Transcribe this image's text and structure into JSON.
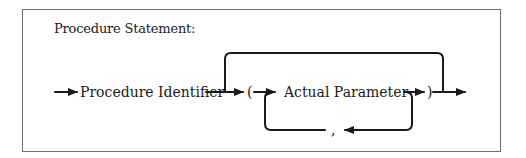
{
  "diagram": {
    "title": "Procedure Statement:",
    "nodes": {
      "procedure_identifier": "Procedure Identifier",
      "open_paren": "(",
      "actual_parameter": "Actual Parameter",
      "close_paren": ")",
      "comma": ","
    },
    "edges": [
      {
        "from": "start",
        "to": "procedure_identifier"
      },
      {
        "from": "procedure_identifier",
        "to": "open_paren"
      },
      {
        "from": "procedure_identifier",
        "to": "end",
        "type": "bypass"
      },
      {
        "from": "open_paren",
        "to": "actual_parameter"
      },
      {
        "from": "actual_parameter",
        "to": "close_paren"
      },
      {
        "from": "actual_parameter",
        "to": "comma",
        "type": "loop"
      },
      {
        "from": "comma",
        "to": "actual_parameter",
        "type": "loop"
      },
      {
        "from": "close_paren",
        "to": "end"
      }
    ],
    "colors": {
      "line": "#1a1a1a",
      "border": "#6e6e6e",
      "background": "#ffffff"
    }
  }
}
